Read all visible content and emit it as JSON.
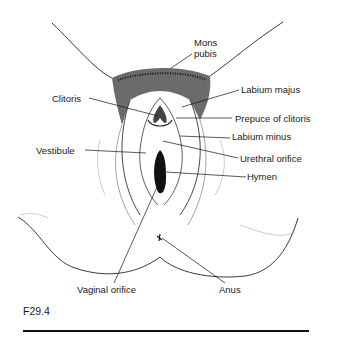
{
  "figure": {
    "caption": "F29.4",
    "labels": {
      "mons_pubis_line1": "Mons",
      "mons_pubis_line2": "pubis",
      "labium_majus": "Labium majus",
      "clitoris": "Clitoris",
      "prepuce_of_clitoris": "Prepuce of clitoris",
      "labium_minus": "Labium minus",
      "vestibule": "Vestibule",
      "urethral_orifice": "Urethral orifice",
      "hymen": "Hymen",
      "vaginal_orifice": "Vaginal orifice",
      "anus": "Anus"
    }
  }
}
